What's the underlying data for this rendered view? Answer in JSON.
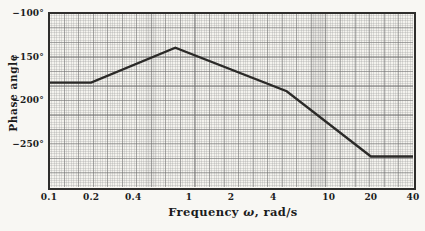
{
  "colors": {
    "background": "#f8f7f3",
    "plot_background": "#f4f3ee",
    "grid_fine": "#9a9a9a",
    "grid_major": "#6e6e6e",
    "line": "#2b2a28",
    "border": "#2f2e2c",
    "text": "#1c1c1c"
  },
  "axes": {
    "y_title": "Phase angle",
    "x_title_prefix": "Frequency ",
    "x_title_omega": "ω",
    "x_title_suffix": ", rad/s"
  },
  "chart_data": {
    "type": "line",
    "title": "",
    "xlabel": "Frequency ω, rad/s",
    "ylabel": "Phase angle",
    "x_scale": "log",
    "xlim": [
      0.1,
      40
    ],
    "ylim": [
      -300,
      -100
    ],
    "x_ticks": [
      0.1,
      0.2,
      0.4,
      1,
      2,
      4,
      10,
      20,
      40
    ],
    "x_tick_labels": [
      "0.1",
      "0.2",
      "0.4",
      "1",
      "2",
      "4",
      "10",
      "20",
      "40"
    ],
    "y_ticks": [
      -100,
      -150,
      -200,
      -250
    ],
    "y_tick_labels": [
      "−100°",
      "−150°",
      "−200°",
      "−250°"
    ],
    "grid": true,
    "legend": null,
    "series": [
      {
        "name": "phase-angle-curve",
        "x": [
          0.1,
          0.2,
          0.8,
          5,
          20,
          40
        ],
        "y": [
          -180,
          -180,
          -140,
          -190,
          -265,
          -265
        ]
      }
    ]
  }
}
